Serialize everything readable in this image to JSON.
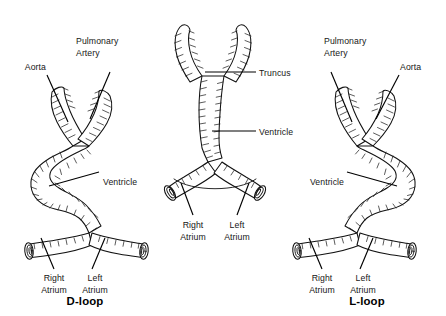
{
  "figure": {
    "background_color": "#ffffff",
    "ink_color": "#111111"
  },
  "panels": [
    {
      "id": "d-loop",
      "title": "D-loop",
      "labels": {
        "aorta": "Aorta",
        "pulmonary_artery_line1": "Pulmonary",
        "pulmonary_artery_line2": "Artery",
        "ventricle": "Ventricle",
        "right_atrium_line1": "Right",
        "right_atrium_line2": "Atrium",
        "left_atrium_line1": "Left",
        "left_atrium_line2": "Atrium"
      }
    },
    {
      "id": "straight-tube",
      "title": "",
      "labels": {
        "truncus": "Truncus",
        "ventricle": "Ventricle",
        "right_atrium_line1": "Right",
        "right_atrium_line2": "Atrium",
        "left_atrium_line1": "Left",
        "left_atrium_line2": "Atrium"
      }
    },
    {
      "id": "l-loop",
      "title": "L-loop",
      "labels": {
        "pulmonary_artery_line1": "Pulmonary",
        "pulmonary_artery_line2": "Artery",
        "aorta": "Aorta",
        "ventricle": "Ventricle",
        "right_atrium_line1": "Right",
        "right_atrium_line2": "Atrium",
        "left_atrium_line1": "Left",
        "left_atrium_line2": "Atrium"
      }
    }
  ]
}
